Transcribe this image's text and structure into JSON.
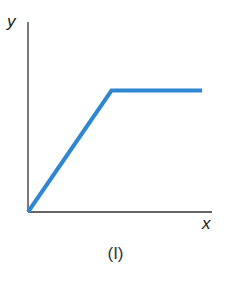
{
  "chart_data": {
    "type": "line",
    "title": "",
    "caption": "(I)",
    "xlabel": "x",
    "ylabel": "y",
    "series": [
      {
        "name": "y(x)",
        "color": "#2f86d1",
        "points": [
          {
            "x": 0,
            "y": 0
          },
          {
            "x": 0.48,
            "y": 0.81
          },
          {
            "x": 1.0,
            "y": 0.81
          }
        ]
      }
    ],
    "xlim": [
      0,
      1.1
    ],
    "ylim": [
      0,
      1.1
    ],
    "ticks": "none",
    "grid": false,
    "legend": "none"
  },
  "labels": {
    "y_axis": "y",
    "x_axis": "x",
    "caption": "(I)"
  }
}
